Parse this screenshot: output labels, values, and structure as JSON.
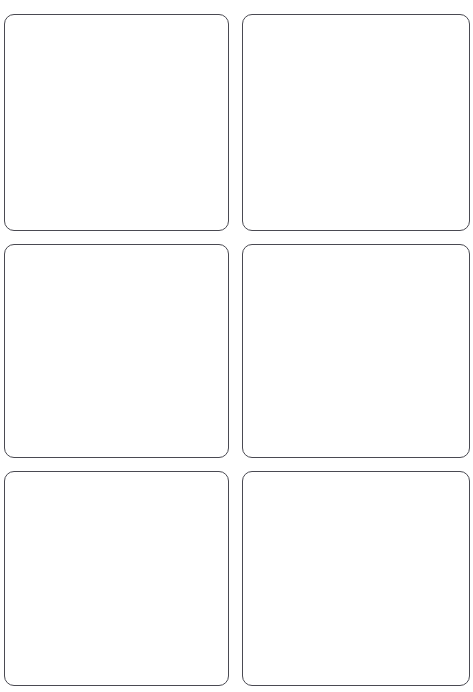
{
  "page": {
    "background_color": "#ffffff",
    "width": 473,
    "height": 692
  },
  "sheet": {
    "type": "blank-label-sheet",
    "columns": 2,
    "rows": 3,
    "card_count": 6,
    "border_color": "#4a4a52",
    "border_width_px": 1.3,
    "corner_radius_px": 10,
    "card_fill_color": "#ffffff",
    "cards": [
      {
        "id": "card-1",
        "row": 1,
        "column": 1,
        "content": ""
      },
      {
        "id": "card-2",
        "row": 1,
        "column": 2,
        "content": ""
      },
      {
        "id": "card-3",
        "row": 2,
        "column": 1,
        "content": ""
      },
      {
        "id": "card-4",
        "row": 2,
        "column": 2,
        "content": ""
      },
      {
        "id": "card-5",
        "row": 3,
        "column": 1,
        "content": ""
      },
      {
        "id": "card-6",
        "row": 3,
        "column": 2,
        "content": ""
      }
    ]
  }
}
